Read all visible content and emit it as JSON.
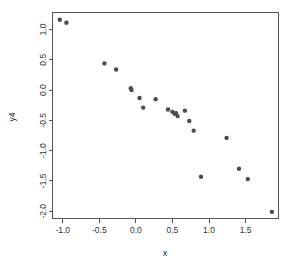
{
  "chart_data": {
    "type": "scatter",
    "title": "",
    "xlabel": "x",
    "ylabel": "y4",
    "xlim": [
      -1.14,
      1.95
    ],
    "ylim": [
      -2.12,
      1.28
    ],
    "grid": false,
    "legend": null,
    "point_color": "#4b4b4b",
    "point_symbol": "filled-circle",
    "xticks": [
      -1.0,
      -0.5,
      0.0,
      0.5,
      1.0,
      1.5
    ],
    "xticklabels": [
      "-1.0",
      "-0.5",
      "0.0",
      "0.5",
      "1.0",
      "1.5"
    ],
    "yticks": [
      1.0,
      0.5,
      0.0,
      -0.5,
      -1.0,
      -1.5,
      -2.0
    ],
    "yticklabels": [
      "1.0",
      "0.5",
      "0.0",
      "-0.5",
      "-1.0",
      "-1.5",
      "-2.0"
    ],
    "x": [
      -1.04,
      -0.95,
      -0.43,
      -0.27,
      -0.07,
      -0.06,
      0.05,
      0.1,
      0.27,
      0.44,
      0.5,
      0.53,
      0.57,
      0.67,
      0.73,
      0.79,
      0.89,
      1.24,
      1.41,
      1.53,
      1.86,
      0.55
    ],
    "y": [
      1.16,
      1.11,
      0.44,
      0.34,
      0.03,
      0.0,
      -0.13,
      -0.29,
      -0.15,
      -0.32,
      -0.36,
      -0.39,
      -0.43,
      -0.34,
      -0.51,
      -0.67,
      -1.43,
      -0.79,
      -1.3,
      -1.47,
      -2.01,
      -0.38
    ],
    "points": [
      {
        "x": -1.04,
        "y": 1.16
      },
      {
        "x": -0.95,
        "y": 1.11
      },
      {
        "x": -0.43,
        "y": 0.44
      },
      {
        "x": -0.27,
        "y": 0.34
      },
      {
        "x": -0.07,
        "y": 0.03
      },
      {
        "x": -0.06,
        "y": 0.0
      },
      {
        "x": 0.05,
        "y": -0.13
      },
      {
        "x": 0.1,
        "y": -0.29
      },
      {
        "x": 0.27,
        "y": -0.15
      },
      {
        "x": 0.44,
        "y": -0.32
      },
      {
        "x": 0.5,
        "y": -0.36
      },
      {
        "x": 0.53,
        "y": -0.39
      },
      {
        "x": 0.55,
        "y": -0.38
      },
      {
        "x": 0.57,
        "y": -0.43
      },
      {
        "x": 0.67,
        "y": -0.34
      },
      {
        "x": 0.73,
        "y": -0.51
      },
      {
        "x": 0.79,
        "y": -0.67
      },
      {
        "x": 0.89,
        "y": -1.43
      },
      {
        "x": 1.24,
        "y": -0.79
      },
      {
        "x": 1.41,
        "y": -1.3
      },
      {
        "x": 1.53,
        "y": -1.47
      },
      {
        "x": 1.86,
        "y": -2.01
      }
    ],
    "n_points": 22
  }
}
